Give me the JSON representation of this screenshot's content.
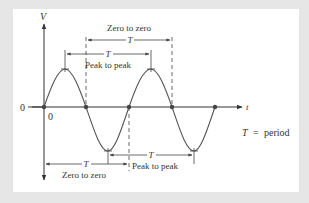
{
  "diagram": {
    "axes": {
      "y_label": "V",
      "x_label": "t",
      "origin_y_label": "0",
      "origin_x_label": "0"
    },
    "annotations": {
      "top_zero": {
        "label": "Zero to zero",
        "symbol": "T"
      },
      "top_peak": {
        "label": "Peak to peak",
        "symbol": "T"
      },
      "bottom_peak": {
        "label": "Peak to peak",
        "symbol": "T"
      },
      "bottom_zero": {
        "label": "Zero to zero",
        "symbol": "T"
      }
    },
    "legend": {
      "symbol": "T",
      "equals": "=",
      "meaning": "period"
    },
    "colors": {
      "background": "#e6e6e6",
      "panel": "#ffffff",
      "curve": "#555555",
      "axis": "#333333",
      "text": "#333333"
    }
  }
}
